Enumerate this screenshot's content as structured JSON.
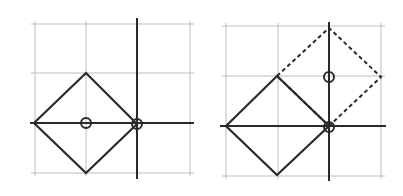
{
  "figure": {
    "panels": [
      {
        "id": "left",
        "grid_x": [
          35,
          86,
          190
        ],
        "grid_y": [
          24,
          73,
          173
        ],
        "axis_v": {
          "x": 137,
          "y1": 18,
          "y2": 179
        },
        "axis_h": {
          "y": 123,
          "x1": 30,
          "x2": 194
        },
        "square": "34,123 86,73 137,124 86,173",
        "dashed_square": null,
        "circles": [
          {
            "cx": 86,
            "cy": 123
          },
          {
            "cx": 137,
            "cy": 124
          }
        ]
      },
      {
        "id": "right",
        "grid_x": [
          226,
          278,
          381
        ],
        "grid_y": [
          26,
          76,
          176
        ],
        "axis_v": {
          "x": 329,
          "y1": 22,
          "y2": 181
        },
        "axis_h": {
          "y": 126,
          "x1": 220,
          "x2": 386
        },
        "square": "226,126 277,76 329,126 277,175",
        "dashed_square": "277,76 329,28 381,77 329,126",
        "circles": [
          {
            "cx": 329,
            "cy": 77
          },
          {
            "cx": 329,
            "cy": 127
          }
        ]
      }
    ],
    "colors": {
      "grid": "#bdbdbd",
      "stroke": "#2a2a2a"
    }
  }
}
